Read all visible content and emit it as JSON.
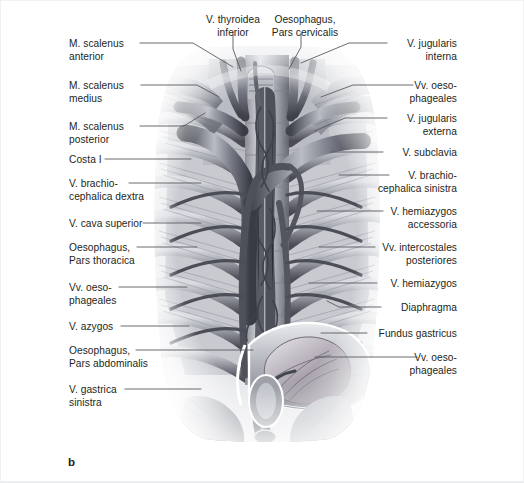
{
  "figure": {
    "panel_letter": "b",
    "caption_subject": "Venae of the posterior thoracic wall and mediastinum",
    "background_color": "#ffffff",
    "text_color": "#231f20",
    "leader_line_color": "#5a5a60",
    "illustration": {
      "name": "thoracic-venous-system-illustration",
      "style": "grayscale anatomical airbrush rendering",
      "tones": [
        "#ffffff",
        "#e8e9ec",
        "#c6c8cd",
        "#9a9ca4",
        "#6f717a",
        "#4a4c55",
        "#2b2d34"
      ]
    }
  },
  "labels_top": [
    {
      "id": "v-thyroidea-inferior",
      "text": "V. thyroidea\ninferior",
      "x": 191,
      "y": 12,
      "width": 82,
      "align": "center"
    },
    {
      "id": "oesophagus-pars-cervicalis",
      "text": "Oesophagus,\nPars cervicalis",
      "x": 256,
      "y": 12,
      "width": 96,
      "align": "center"
    }
  ],
  "labels_left": [
    {
      "id": "m-scalenus-anterior",
      "text": "M. scalenus\nanterior",
      "x": 68,
      "y": 36
    },
    {
      "id": "m-scalenus-medius",
      "text": "M. scalenus\nmedius",
      "x": 68,
      "y": 78
    },
    {
      "id": "m-scalenus-posterior",
      "text": "M. scalenus\nposterior",
      "x": 68,
      "y": 119
    },
    {
      "id": "costa-i",
      "text": "Costa I",
      "x": 68,
      "y": 152
    },
    {
      "id": "v-brachiocephalica-dextra",
      "text": "V. brachio-\ncephalica dextra",
      "x": 68,
      "y": 176
    },
    {
      "id": "v-cava-superior",
      "text": "V. cava superior",
      "x": 68,
      "y": 216
    },
    {
      "id": "oesophagus-pars-thoracica",
      "text": "Oesophagus,\nPars thoracica",
      "x": 68,
      "y": 240
    },
    {
      "id": "vv-oesophageales-left",
      "text": "Vv. oeso-\nphageales",
      "x": 68,
      "y": 280
    },
    {
      "id": "v-azygos",
      "text": "V. azygos",
      "x": 68,
      "y": 319
    },
    {
      "id": "oesophagus-pars-abdominalis",
      "text": "Oesophagus,\nPars abdominalis",
      "x": 68,
      "y": 343
    },
    {
      "id": "v-gastrica-sinistra",
      "text": "V. gastrica\nsinistra",
      "x": 68,
      "y": 382
    }
  ],
  "labels_right": [
    {
      "id": "v-jugularis-interna",
      "text": "V. jugularis\ninterna",
      "right": 66,
      "y": 36
    },
    {
      "id": "vv-oesophageales-upper-right",
      "text": "Vv. oeso-\nphageales",
      "right": 66,
      "y": 78
    },
    {
      "id": "v-jugularis-externa",
      "text": "V. jugularis\nexterna",
      "right": 66,
      "y": 111
    },
    {
      "id": "v-subclavia",
      "text": "V. subclavia",
      "right": 66,
      "y": 145
    },
    {
      "id": "v-brachiocephalica-sinistra",
      "text": "V. brachio-\ncephalica sinistra",
      "right": 66,
      "y": 168
    },
    {
      "id": "v-hemiazygos-accessoria",
      "text": "V. hemiazygos\naccessoria",
      "right": 66,
      "y": 204
    },
    {
      "id": "vv-intercostales-posteriores",
      "text": "Vv. intercostales\nposteriores",
      "right": 66,
      "y": 240
    },
    {
      "id": "v-hemiazygos",
      "text": "V. hemiazygos",
      "right": 66,
      "y": 276
    },
    {
      "id": "diaphragma",
      "text": "Diaphragma",
      "right": 66,
      "y": 300
    },
    {
      "id": "fundus-gastricus",
      "text": "Fundus gastricus",
      "right": 66,
      "y": 326
    },
    {
      "id": "vv-oesophageales-lower-right",
      "text": "Vv. oeso-\nphageales",
      "right": 66,
      "y": 350
    }
  ],
  "leader_lines": [
    {
      "id": "leader-m-scalenus-anterior",
      "points": "139,42 192,42 232,66"
    },
    {
      "id": "leader-m-scalenus-medius",
      "points": "140,84 196,84 218,96"
    },
    {
      "id": "leader-m-scalenus-posterior",
      "points": "139,125 183,125 204,112"
    },
    {
      "id": "leader-costa-i",
      "points": "104,158 190,158"
    },
    {
      "id": "leader-v-brachiocephalica-dextra",
      "points": "128,182 200,182"
    },
    {
      "id": "leader-v-cava-superior",
      "points": "142,222 200,222"
    },
    {
      "id": "leader-oesophagus-pars-thoracica",
      "points": "136,246 196,246"
    },
    {
      "id": "leader-vv-oesophageales-left",
      "points": "118,286 186,286"
    },
    {
      "id": "leader-v-azygos",
      "points": "120,325 188,325"
    },
    {
      "id": "leader-oesophagus-abdominalis",
      "points": "135,349 252,349"
    },
    {
      "id": "leader-v-gastrica-sinistra",
      "points": "124,388 200,388"
    },
    {
      "id": "leader-v-thyroidea-inferior",
      "points": "232,32 232,48 240,70"
    },
    {
      "id": "leader-oesophagus-cervicalis",
      "points": "300,32 300,46 288,68"
    },
    {
      "id": "leader-v-jugularis-interna",
      "points": "386,42 348,42 300,62"
    },
    {
      "id": "leader-vv-oesophageales-ur",
      "points": "412,84 352,84 320,96"
    },
    {
      "id": "leader-v-jugularis-externa",
      "points": "386,117 344,117 314,130"
    },
    {
      "id": "leader-v-subclavia",
      "points": "382,151 330,151"
    },
    {
      "id": "leader-v-brachiocephalica-sin",
      "points": "388,174 338,174"
    },
    {
      "id": "leader-v-hemiazygos-accessoria",
      "points": "382,210 316,210"
    },
    {
      "id": "leader-vv-intercostales-post",
      "points": "374,246 318,246"
    },
    {
      "id": "leader-v-hemiazygos",
      "points": "376,282 308,282"
    },
    {
      "id": "leader-diaphragma",
      "points": "380,306 338,306 326,300"
    },
    {
      "id": "leader-fundus-gastricus",
      "points": "366,332 320,332"
    },
    {
      "id": "leader-vv-oesophageales-lr",
      "points": "416,356 314,356"
    }
  ]
}
